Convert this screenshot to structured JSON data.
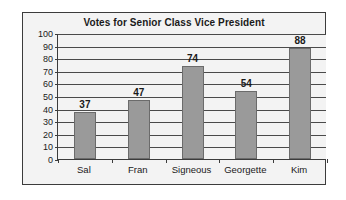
{
  "chart_data": {
    "type": "bar",
    "title": "Votes for Senior Class Vice President",
    "categories": [
      "Sal",
      "Fran",
      "Signeous",
      "Georgette",
      "Kim"
    ],
    "values": [
      37,
      47,
      74,
      54,
      88
    ],
    "xlabel": "",
    "ylabel": "",
    "ylim": [
      0,
      100
    ],
    "ytick_step": 10,
    "yticks": [
      0,
      10,
      20,
      30,
      40,
      50,
      60,
      70,
      80,
      90,
      100
    ],
    "ytick_labels": [
      "0",
      "10",
      "20",
      "30",
      "40",
      "50",
      "60",
      "70",
      "80",
      "90",
      "100"
    ],
    "grid": true,
    "grid_axis": "y",
    "legend": false,
    "data_labels": true,
    "value_labels": [
      "37",
      "47",
      "74",
      "54",
      "88"
    ],
    "colors": {
      "bar_fill": "#9a9a9a",
      "bar_stroke": "#6b6b6b",
      "plot_background": "#f3f3f3",
      "gridline": "#4a4a4a",
      "axis": "#3c3c3c",
      "text": "#1a1a1a",
      "frame_border": "#3c3c3c",
      "page_background": "#ffffff"
    }
  }
}
